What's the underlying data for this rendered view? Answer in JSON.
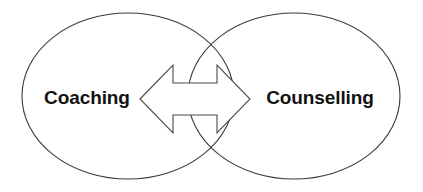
{
  "canvas": {
    "width": 423,
    "height": 192,
    "background_color": "#ffffff"
  },
  "diagram": {
    "type": "venn-two-circle-with-bidirectional-arrow",
    "stroke_color": "#3a3a3a",
    "arrow_stroke_color": "#4a4a4a",
    "arrow_fill_color": "#ffffff",
    "text_color": "#121212"
  },
  "labels": {
    "left": "Coaching",
    "right": "Counselling"
  },
  "shapes": {
    "left_ellipse": {
      "name": "left-ellipse",
      "cx": 128,
      "cy": 96,
      "rx": 106,
      "ry": 83
    },
    "right_ellipse": {
      "name": "right-ellipse",
      "cx": 294,
      "cy": 96,
      "rx": 106,
      "ry": 83
    },
    "arrow": {
      "name": "bidirectional-arrow",
      "x_min": 140,
      "x_max": 250,
      "y_min": 65,
      "y_max": 133,
      "shaft_top": 83,
      "shaft_bottom": 115
    }
  }
}
